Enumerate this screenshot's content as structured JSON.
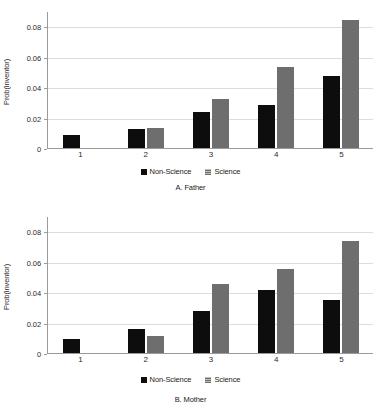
{
  "figure": {
    "panels": [
      {
        "id": "father",
        "caption": "A. Father",
        "ylabel": "Prob(inventor)",
        "yticks": [
          "0",
          "0.02",
          "0.04",
          "0.06",
          "0.08"
        ],
        "xticks": [
          "1",
          "2",
          "3",
          "4",
          "5"
        ],
        "legend": [
          {
            "label": "Non-Science",
            "color": "#0d0d0d",
            "key": "ns"
          },
          {
            "label": "Science",
            "color": "#6e6e6e",
            "key": "sci"
          }
        ]
      },
      {
        "id": "mother",
        "caption": "B. Mother",
        "ylabel": "Prob(inventor)",
        "yticks": [
          "0",
          "0.02",
          "0.04",
          "0.06",
          "0.08"
        ],
        "xticks": [
          "1",
          "2",
          "3",
          "4",
          "5"
        ],
        "legend": [
          {
            "label": "Non-Science",
            "color": "#0d0d0d",
            "key": "ns"
          },
          {
            "label": "Science",
            "color": "#6e6e6e",
            "key": "sci"
          }
        ]
      }
    ]
  },
  "chart_data": [
    {
      "type": "bar",
      "title": "A. Father",
      "xlabel": "",
      "ylabel": "Prob(inventor)",
      "categories": [
        "1",
        "2",
        "3",
        "4",
        "5"
      ],
      "ylim": [
        0,
        0.09
      ],
      "yticks": [
        0,
        0.02,
        0.04,
        0.06,
        0.08
      ],
      "grid": true,
      "legend_position": "bottom",
      "series": [
        {
          "name": "Non-Science",
          "color": "#0d0d0d",
          "values": [
            0.0088,
            0.0122,
            0.0238,
            0.0285,
            0.047
          ]
        },
        {
          "name": "Science",
          "color": "#6e6e6e",
          "values": [
            null,
            0.0131,
            0.0319,
            0.053,
            0.0843
          ]
        }
      ]
    },
    {
      "type": "bar",
      "title": "B. Mother",
      "xlabel": "",
      "ylabel": "Prob(inventor)",
      "categories": [
        "1",
        "2",
        "3",
        "4",
        "5"
      ],
      "ylim": [
        0,
        0.09
      ],
      "yticks": [
        0,
        0.02,
        0.04,
        0.06,
        0.08
      ],
      "grid": true,
      "legend_position": "bottom",
      "series": [
        {
          "name": "Non-Science",
          "color": "#0d0d0d",
          "values": [
            0.0095,
            0.0155,
            0.0277,
            0.0412,
            0.0347
          ]
        },
        {
          "name": "Science",
          "color": "#6e6e6e",
          "values": [
            null,
            0.0111,
            0.0451,
            0.0554,
            0.0735
          ]
        }
      ]
    }
  ]
}
